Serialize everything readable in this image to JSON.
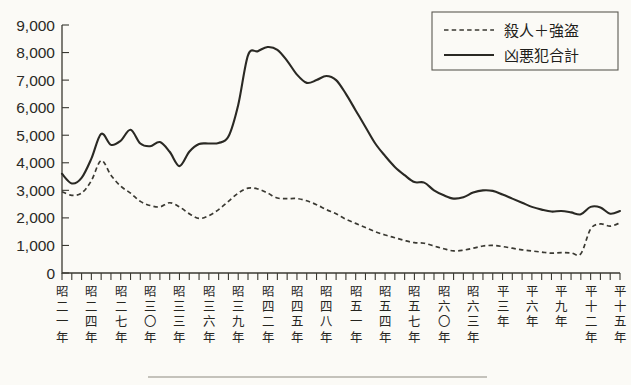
{
  "chart_data": {
    "type": "line",
    "title": "",
    "xlabel": "",
    "ylabel": "",
    "ylim": [
      0,
      9000
    ],
    "ytick_step": 1000,
    "grid": false,
    "legend_position": "top-right",
    "ytick_labels": [
      "9,000",
      "8,000",
      "7,000",
      "6,000",
      "5,000",
      "4,000",
      "3,000",
      "2,000",
      "1,000",
      "0"
    ],
    "ytick_values": [
      9000,
      8000,
      7000,
      6000,
      5000,
      4000,
      3000,
      2000,
      1000,
      0
    ],
    "x": [
      1946,
      1947,
      1948,
      1949,
      1950,
      1951,
      1952,
      1953,
      1954,
      1955,
      1956,
      1957,
      1958,
      1959,
      1960,
      1961,
      1962,
      1963,
      1964,
      1965,
      1966,
      1967,
      1968,
      1969,
      1970,
      1971,
      1972,
      1973,
      1974,
      1975,
      1976,
      1977,
      1978,
      1979,
      1980,
      1981,
      1982,
      1983,
      1984,
      1985,
      1986,
      1987,
      1988,
      1989,
      1990,
      1991,
      1992,
      1993,
      1994,
      1995,
      1996,
      1997,
      1998,
      1999,
      2000,
      2001,
      2002,
      2003
    ],
    "xtick_labels": [
      "昭二一年",
      "昭二四年",
      "昭二七年",
      "昭三〇年",
      "昭三三年",
      "昭三六年",
      "昭三九年",
      "昭四二年",
      "昭四五年",
      "昭四八年",
      "昭五一年",
      "昭五四年",
      "昭五七年",
      "昭六〇年",
      "昭六三年",
      "平三年",
      "平六年",
      "平九年",
      "平十二年",
      "平十五年"
    ],
    "xtick_label_chars": [
      [
        "昭",
        "二",
        "一",
        "年"
      ],
      [
        "昭",
        "二",
        "四",
        "年"
      ],
      [
        "昭",
        "二",
        "七",
        "年"
      ],
      [
        "昭",
        "三",
        "〇",
        "年"
      ],
      [
        "昭",
        "三",
        "三",
        "年"
      ],
      [
        "昭",
        "三",
        "六",
        "年"
      ],
      [
        "昭",
        "三",
        "九",
        "年"
      ],
      [
        "昭",
        "四",
        "二",
        "年"
      ],
      [
        "昭",
        "四",
        "五",
        "年"
      ],
      [
        "昭",
        "四",
        "八",
        "年"
      ],
      [
        "昭",
        "五",
        "一",
        "年"
      ],
      [
        "昭",
        "五",
        "四",
        "年"
      ],
      [
        "昭",
        "五",
        "七",
        "年"
      ],
      [
        "昭",
        "六",
        "〇",
        "年"
      ],
      [
        "昭",
        "六",
        "三",
        "年"
      ],
      [
        "平",
        "三",
        "年"
      ],
      [
        "平",
        "六",
        "年"
      ],
      [
        "平",
        "九",
        "年"
      ],
      [
        "平",
        "十",
        "二",
        "年"
      ],
      [
        "平",
        "十",
        "五",
        "年"
      ]
    ],
    "xtick_indices": [
      0,
      3,
      6,
      9,
      12,
      15,
      18,
      21,
      24,
      27,
      30,
      33,
      36,
      39,
      42,
      45,
      48,
      51,
      54,
      57
    ],
    "series": [
      {
        "name": "凶悪犯合計",
        "style": "solid",
        "color": "#2a2924",
        "values": [
          3600,
          3250,
          3450,
          4150,
          5050,
          4650,
          4800,
          5200,
          4700,
          4600,
          4750,
          4400,
          3880,
          4400,
          4680,
          4700,
          4720,
          4950,
          6100,
          7900,
          8050,
          8200,
          8100,
          7700,
          7200,
          6900,
          7000,
          7150,
          7000,
          6500,
          5900,
          5300,
          4700,
          4250,
          3850,
          3550,
          3300,
          3280,
          3000,
          2820,
          2700,
          2750,
          2920,
          3000,
          2980,
          2850,
          2700,
          2550,
          2400,
          2300,
          2230,
          2250,
          2200,
          2130,
          2400,
          2380,
          2150,
          2250
        ]
      },
      {
        "name": "殺人＋強盗",
        "style": "dashed",
        "color": "#3a3932",
        "values": [
          2950,
          2820,
          2900,
          3350,
          4080,
          3550,
          3150,
          2900,
          2600,
          2450,
          2400,
          2550,
          2400,
          2150,
          1980,
          2080,
          2300,
          2600,
          2900,
          3080,
          3050,
          2900,
          2720,
          2700,
          2700,
          2620,
          2480,
          2300,
          2150,
          1950,
          1800,
          1650,
          1500,
          1380,
          1280,
          1180,
          1100,
          1080,
          980,
          880,
          800,
          830,
          900,
          980,
          1000,
          960,
          900,
          840,
          800,
          760,
          720,
          740,
          730,
          700,
          1600,
          1780,
          1700,
          1820
        ]
      }
    ],
    "legend": [
      {
        "label": "殺人＋強盗",
        "style": "dashed"
      },
      {
        "label": "凶悪犯合計",
        "style": "solid"
      }
    ]
  }
}
